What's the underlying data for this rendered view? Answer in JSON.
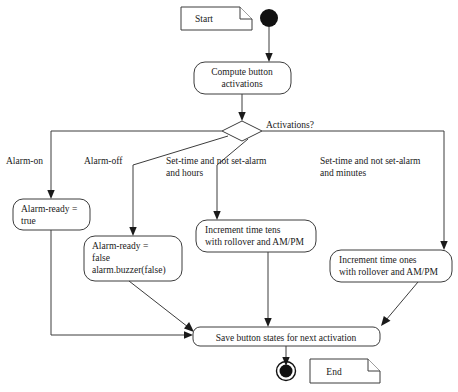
{
  "diagram": {
    "background_color": "#ffffff",
    "line_color": "#3c3c3c",
    "text_color": "#1a1a1a"
  },
  "notes": {
    "start_note": "Start",
    "end_note": "End"
  },
  "nodes": {
    "initial": "initial-node",
    "compute": {
      "line1": "Compute button",
      "line2": "activations"
    },
    "decision_label": "Activations?",
    "alarm_ready_true": {
      "line1": "Alarm-ready =",
      "line2": "true"
    },
    "alarm_ready_false": {
      "line1": "Alarm-ready =",
      "line2": "false",
      "line3": "alarm.buzzer(false)"
    },
    "increment_tens": {
      "line1": "Increment time tens",
      "line2": "with rollover and AM/PM"
    },
    "increment_ones": {
      "line1": "Increment time ones",
      "line2": "with rollover and AM/PM"
    },
    "save_states": "Save button states for next activation",
    "final": "final-node"
  },
  "guards": {
    "alarm_on": "Alarm-on",
    "alarm_off": "Alarm-off",
    "set_time_hours": {
      "line1": "Set-time and not set-alarm",
      "line2": "and hours"
    },
    "set_time_minutes": {
      "line1": "Set-time and not set-alarm",
      "line2": "and minutes"
    }
  }
}
